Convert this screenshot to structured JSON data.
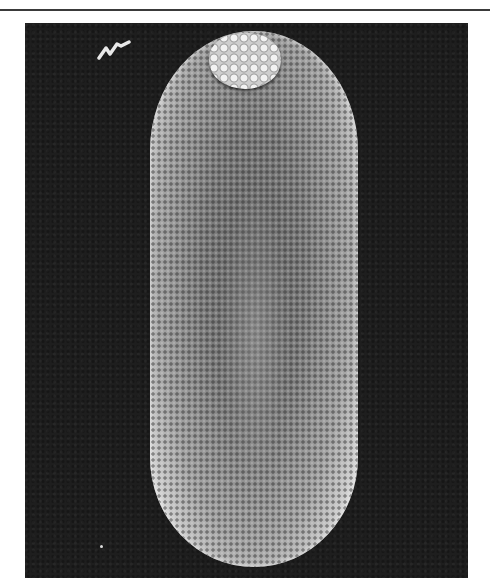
{
  "page": {
    "header_text_partial": "",
    "figure": {
      "type": "scanning electron micrograph",
      "subject": "elongated egg with micropylar cap",
      "background_color": "#1e1e1e",
      "subject_color": "#8a8a8a",
      "highlight_color": "#f2f2f2"
    }
  }
}
